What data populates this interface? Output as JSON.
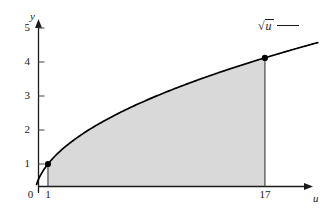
{
  "figure": {
    "background_color": "#ffffff",
    "axis_color": "#1a1a1a",
    "curve_color": "#000000",
    "fill_color": "#d9d9d9",
    "point_color": "#000000"
  },
  "axes": {
    "y_name": "y",
    "x_name": "u",
    "origin_label": "0"
  },
  "legend": {
    "radical_sign": "√",
    "radicand": "u",
    "line_swatch": "solid-line"
  },
  "chart_data": {
    "type": "line",
    "title": "",
    "xlabel": "u",
    "ylabel": "y",
    "xlim": [
      0,
      20.5
    ],
    "ylim": [
      0,
      5.4
    ],
    "grid": false,
    "legend_position": "top-right",
    "series": [
      {
        "name": "√u",
        "expression": "sqrt(u)",
        "color": "#000000",
        "x": [
          0.2,
          0.5,
          1,
          2,
          3,
          4,
          5,
          6,
          7,
          8,
          9,
          10,
          11,
          12,
          13,
          14,
          15,
          16,
          17,
          18,
          19,
          20
        ],
        "values": [
          0.45,
          0.71,
          1.0,
          1.41,
          1.73,
          2.0,
          2.24,
          2.45,
          2.65,
          2.83,
          3.0,
          3.16,
          3.32,
          3.46,
          3.61,
          3.74,
          3.87,
          4.0,
          4.12,
          4.24,
          4.36,
          4.47
        ]
      }
    ],
    "marked_points": [
      {
        "x": 1,
        "y": 1.0,
        "label": "1"
      },
      {
        "x": 17,
        "y": 4.12,
        "label": "17"
      }
    ],
    "shaded_region": {
      "description": "area under sqrt(u) from u=1 to u=17",
      "x_from": 1,
      "x_to": 17,
      "color": "#d9d9d9"
    },
    "y_ticks": [
      {
        "value": 5,
        "label": "5"
      },
      {
        "value": 4,
        "label": "4"
      },
      {
        "value": 3,
        "label": "3"
      },
      {
        "value": 2,
        "label": "2"
      },
      {
        "value": 1,
        "label": "1"
      }
    ],
    "x_ticks": [
      {
        "value": 0,
        "label": "0"
      },
      {
        "value": 1,
        "label": "1"
      },
      {
        "value": 17,
        "label": "17"
      }
    ]
  }
}
